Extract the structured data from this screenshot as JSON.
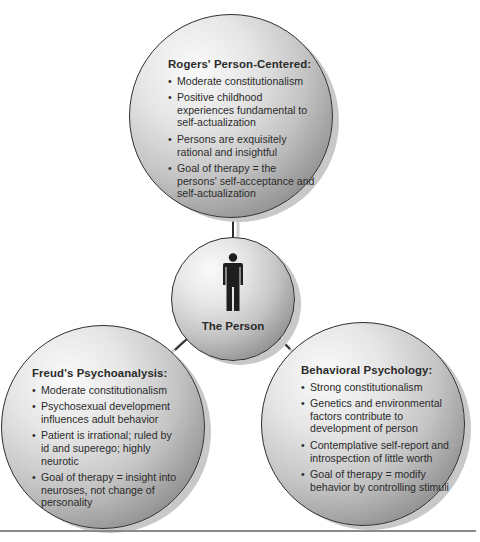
{
  "center": {
    "label": "The Person",
    "icon": "person-icon"
  },
  "nodes": {
    "top": {
      "title": "Rogers' Person-Centered:",
      "items": [
        "Moderate constitutionalism",
        "Positive childhood experiences fundamental to self-actualization",
        "Persons are exquisitely rational and insightful",
        "Goal of therapy = the persons' self-acceptance and self-actualization"
      ]
    },
    "left": {
      "title": "Freud's Psychoanalysis:",
      "items": [
        "Moderate constitutionalism",
        "Psychosexual development influences adult behavior",
        "Patient is irrational; ruled by id and superego; highly neurotic",
        "Goal of therapy = insight into neuroses, not change of personality"
      ]
    },
    "right": {
      "title": "Behavioral Psychology:",
      "items": [
        "Strong constitutionalism",
        "Genetics and environmental factors contribute to development of person",
        "Contemplative self-report and introspection of little worth",
        "Goal of therapy = modify behavior by controlling stimuli"
      ]
    }
  },
  "bullet_glyph": "•",
  "colors": {
    "outline": "#2e2e2e",
    "connector": "#2e2e2e",
    "connector_shadow": "#c8c8c8",
    "text": "#2b2b2b",
    "rule": "#8a8a8a"
  }
}
